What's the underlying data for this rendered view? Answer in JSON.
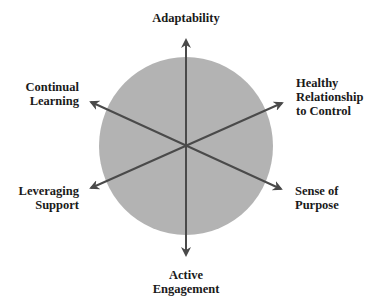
{
  "diagram": {
    "type": "radial-six-axis",
    "circle_color": "#b3b3b3",
    "arrow_color": "#4a4a4a",
    "labels": {
      "top": [
        "Adaptability"
      ],
      "upper_left": [
        "Continual",
        "Learning"
      ],
      "upper_right": [
        "Healthy",
        "Relationship",
        "to Control"
      ],
      "lower_left": [
        "Leveraging",
        "Support"
      ],
      "lower_right": [
        "Sense of",
        "Purpose"
      ],
      "bottom": [
        "Active",
        "Engagement"
      ]
    }
  }
}
